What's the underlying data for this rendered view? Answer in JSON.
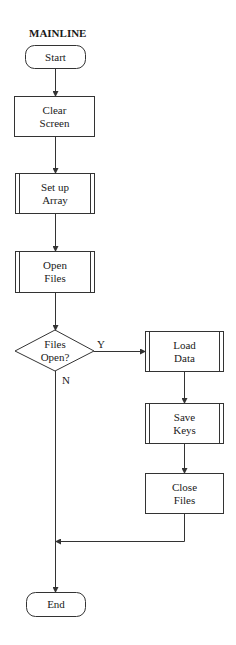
{
  "title": "MAINLINE",
  "nodes": {
    "start": {
      "label": "Start",
      "shape": "terminal"
    },
    "clear_screen": {
      "label": "Clear\nScreen",
      "shape": "process"
    },
    "setup_array": {
      "label": "Set up\nArray",
      "shape": "predefined-process"
    },
    "open_files": {
      "label": "Open\nFiles",
      "shape": "predefined-process"
    },
    "files_open": {
      "label": "Files\nOpen?",
      "shape": "decision"
    },
    "load_data": {
      "label": "Load\nData",
      "shape": "predefined-process"
    },
    "save_keys": {
      "label": "Save\nKeys",
      "shape": "predefined-process"
    },
    "close_files": {
      "label": "Close\nFiles",
      "shape": "process"
    },
    "end": {
      "label": "End",
      "shape": "terminal"
    }
  },
  "branches": {
    "yes": "Y",
    "no": "N"
  },
  "edges": [
    [
      "start",
      "clear_screen"
    ],
    [
      "clear_screen",
      "setup_array"
    ],
    [
      "setup_array",
      "open_files"
    ],
    [
      "open_files",
      "files_open"
    ],
    [
      "files_open",
      "load_data",
      "Y"
    ],
    [
      "files_open",
      "end",
      "N"
    ],
    [
      "load_data",
      "save_keys"
    ],
    [
      "save_keys",
      "close_files"
    ],
    [
      "close_files",
      "end"
    ]
  ],
  "colors": {
    "stroke": "#333333",
    "background": "#ffffff"
  }
}
